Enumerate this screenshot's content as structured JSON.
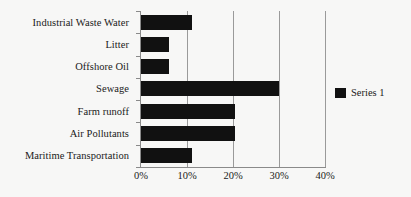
{
  "chart_data": {
    "type": "bar",
    "orientation": "horizontal",
    "title": "",
    "subtitle": "",
    "xlabel": "",
    "ylabel": "",
    "categories": [
      "Industrial Waste Water",
      "Litter",
      "Offshore Oil",
      "Sewage",
      "Farm runoff",
      "Air Pollutants",
      "Maritime Transportation"
    ],
    "values": [
      11,
      6,
      6,
      30,
      20.5,
      20.5,
      11
    ],
    "series": [
      {
        "name": "Series 1",
        "color": "#111111",
        "values": [
          11,
          6,
          6,
          30,
          20.5,
          20.5,
          11
        ]
      }
    ],
    "xlim": [
      0,
      40
    ],
    "xticks": [
      0,
      10,
      20,
      30,
      40
    ],
    "xtick_labels": [
      "0%",
      "10%",
      "20%",
      "30%",
      "40%"
    ],
    "grid": true,
    "grid_axis": "x",
    "legend": {
      "visible": true,
      "position": "right",
      "entries": [
        {
          "label": "Series 1",
          "color": "#111111"
        }
      ]
    },
    "colors": {
      "background": "#f7f7f6",
      "bar": "#111111",
      "axis": "#8a8a8a",
      "gridline": "#9a9a9a",
      "text": "#1a1a1a"
    }
  }
}
